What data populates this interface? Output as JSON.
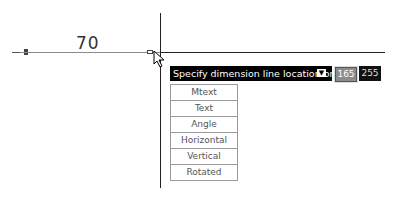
{
  "drawing": {
    "dimension_value": "70"
  },
  "dynamic_input": {
    "prompt": "Specify dimension line location or",
    "options_icon": "down-arrow-icon",
    "value_1": "165",
    "value_2": "255"
  },
  "options_menu": {
    "items": [
      {
        "label": "Mtext"
      },
      {
        "label": "Text"
      },
      {
        "label": "Angle"
      },
      {
        "label": "Horizontal"
      },
      {
        "label": "Vertical"
      },
      {
        "label": "Rotated"
      }
    ]
  }
}
